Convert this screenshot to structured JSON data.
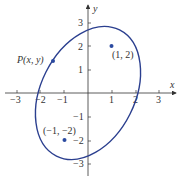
{
  "diagram": {
    "type": "ellipse-with-foci",
    "axes": {
      "x_label": "x",
      "y_label": "y",
      "x_ticks": [
        {
          "value": -3,
          "label": "−3"
        },
        {
          "value": -2,
          "label": "−2"
        },
        {
          "value": -1,
          "label": "−1"
        },
        {
          "value": 1,
          "label": "1"
        },
        {
          "value": 2,
          "label": "2"
        },
        {
          "value": 3,
          "label": "3"
        }
      ],
      "y_ticks": [
        {
          "value": 3,
          "label": "3"
        },
        {
          "value": 2,
          "label": "2"
        },
        {
          "value": 1,
          "label": "1"
        },
        {
          "value": -1,
          "label": "−1"
        },
        {
          "value": -2,
          "label": "−2"
        },
        {
          "value": -3,
          "label": "−3"
        }
      ]
    },
    "points": [
      {
        "label": "(1, 2)",
        "x": 1,
        "y": 2
      },
      {
        "label": "(−1, −2)",
        "x": -1,
        "y": -2
      },
      {
        "label": "P(x, y)",
        "x": -1.5,
        "y": 1.35
      }
    ],
    "ellipse": {
      "center": [
        0,
        0
      ],
      "semi_major": 3,
      "semi_minor": 2,
      "foci": [
        [
          1,
          2
        ],
        [
          -1,
          -2
        ]
      ],
      "color": "#2b3f8f"
    },
    "colors": {
      "curve": "#2b3f8f",
      "point": "#2b4aa0",
      "axis": "#333333"
    }
  }
}
